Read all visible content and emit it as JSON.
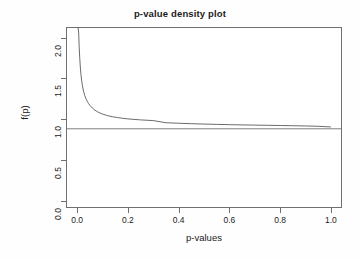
{
  "chart_data": {
    "type": "line",
    "title": "p-value density plot",
    "xlabel": "p-values",
    "ylabel": "f(p)",
    "xlim": [
      -0.04,
      1.04
    ],
    "ylim": [
      -0.08,
      2.12
    ],
    "xticks": [
      "0.0",
      "0.2",
      "0.4",
      "0.6",
      "0.8",
      "1.0"
    ],
    "xtick_values": [
      0.0,
      0.2,
      0.4,
      0.6,
      0.8,
      1.0
    ],
    "yticks": [
      "0.0",
      "0.5",
      "1.0",
      "1.5",
      "2.0"
    ],
    "ytick_values": [
      0.0,
      0.5,
      1.0,
      1.5,
      2.0
    ],
    "grid": false,
    "legend": "none",
    "box": true,
    "series": [
      {
        "name": "p-value density f(p)",
        "x": [
          0.002,
          0.004,
          0.006,
          0.008,
          0.01,
          0.0125,
          0.015,
          0.0175,
          0.02,
          0.025,
          0.03,
          0.035,
          0.04,
          0.045,
          0.05,
          0.06,
          0.07,
          0.08,
          0.09,
          0.1,
          0.12,
          0.14,
          0.16,
          0.18,
          0.2,
          0.25,
          0.3,
          0.35,
          0.4,
          0.45,
          0.5,
          0.55,
          0.6,
          0.65,
          0.7,
          0.75,
          0.8,
          0.85,
          0.9,
          0.95,
          1.0
        ],
        "y": [
          2.12,
          2.12,
          2.06,
          1.89,
          1.76,
          1.64,
          1.55,
          1.48,
          1.425,
          1.345,
          1.29,
          1.25,
          1.218,
          1.192,
          1.17,
          1.136,
          1.11,
          1.091,
          1.075,
          1.062,
          1.043,
          1.029,
          1.019,
          1.01,
          1.003,
          0.9905,
          0.982,
          0.9555,
          0.9495,
          0.944,
          0.9395,
          0.9355,
          0.932,
          0.929,
          0.9265,
          0.924,
          0.9215,
          0.919,
          0.916,
          0.912,
          0.904
        ]
      },
      {
        "name": "reference line",
        "type": "hline",
        "y_value": 0.881
      }
    ]
  }
}
